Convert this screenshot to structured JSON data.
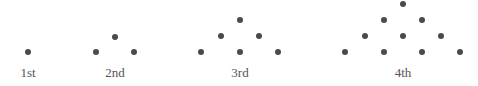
{
  "figures": [
    {
      "label": "1st",
      "dots": [
        [
          28,
          52
        ]
      ]
    },
    {
      "label": "2nd",
      "dots": [
        [
          115,
          37
        ],
        [
          96,
          52
        ],
        [
          134,
          52
        ]
      ]
    },
    {
      "label": "3rd",
      "dots": [
        [
          240,
          20
        ],
        [
          221,
          36
        ],
        [
          259,
          36
        ],
        [
          201,
          52
        ],
        [
          240,
          52
        ],
        [
          278,
          52
        ]
      ]
    },
    {
      "label": "4th",
      "dots": [
        [
          403,
          4
        ],
        [
          384,
          20
        ],
        [
          422,
          20
        ],
        [
          365,
          36
        ],
        [
          403,
          36
        ],
        [
          441,
          36
        ],
        [
          345,
          52
        ],
        [
          384,
          52
        ],
        [
          422,
          52
        ],
        [
          460,
          52
        ]
      ]
    }
  ],
  "label_x": [
    28,
    115,
    240,
    403
  ]
}
